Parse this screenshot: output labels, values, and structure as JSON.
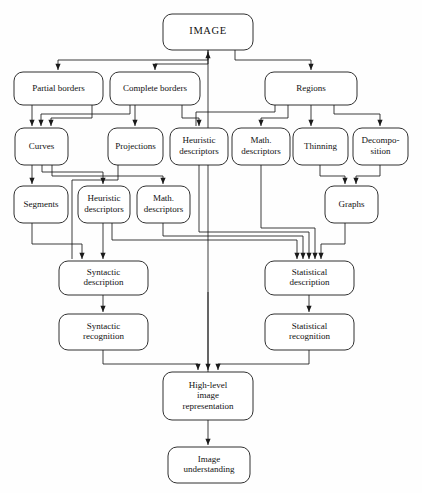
{
  "diagram": {
    "colors": {
      "background": "#fefefe",
      "node_fill": "#ffffff",
      "stroke": "#1a1a1a",
      "text": "#111111"
    },
    "nodes": [
      {
        "id": "image",
        "label": "IMAGE",
        "lines": [
          "IMAGE"
        ],
        "x": 163,
        "y": 14,
        "w": 90,
        "h": 36,
        "rx": 9,
        "emphasis": "root"
      },
      {
        "id": "partial",
        "label": "Partial borders",
        "lines": [
          "Partial borders"
        ],
        "x": 14,
        "y": 72,
        "w": 89,
        "h": 33,
        "rx": 9,
        "emphasis": "normal"
      },
      {
        "id": "complete",
        "label": "Complete borders",
        "lines": [
          "Complete borders"
        ],
        "x": 110,
        "y": 72,
        "w": 90,
        "h": 33,
        "rx": 9,
        "emphasis": "normal"
      },
      {
        "id": "regions",
        "label": "Regions",
        "lines": [
          "Regions"
        ],
        "x": 265,
        "y": 72,
        "w": 92,
        "h": 33,
        "rx": 9,
        "emphasis": "normal"
      },
      {
        "id": "curves",
        "label": "Curves",
        "lines": [
          "Curves"
        ],
        "x": 15,
        "y": 128,
        "w": 53,
        "h": 37,
        "rx": 9,
        "emphasis": "normal"
      },
      {
        "id": "projections",
        "label": "Projections",
        "lines": [
          "Projections"
        ],
        "x": 108,
        "y": 128,
        "w": 55,
        "h": 37,
        "rx": 9,
        "emphasis": "normal"
      },
      {
        "id": "heur1",
        "label": "Heuristic descriptors",
        "lines": [
          "Heuristic",
          "descriptors"
        ],
        "x": 170,
        "y": 128,
        "w": 58,
        "h": 37,
        "rx": 9,
        "emphasis": "normal"
      },
      {
        "id": "math1",
        "label": "Math. descriptors",
        "lines": [
          "Math.",
          "descriptors"
        ],
        "x": 232,
        "y": 128,
        "w": 58,
        "h": 37,
        "rx": 9,
        "emphasis": "normal"
      },
      {
        "id": "thinning",
        "label": "Thinning",
        "lines": [
          "Thinning"
        ],
        "x": 293,
        "y": 128,
        "w": 55,
        "h": 37,
        "rx": 9,
        "emphasis": "normal"
      },
      {
        "id": "decomp",
        "label": "Decomposition",
        "lines": [
          "Decompo-",
          "sition"
        ],
        "x": 353,
        "y": 128,
        "w": 55,
        "h": 37,
        "rx": 9,
        "emphasis": "normal"
      },
      {
        "id": "segments",
        "label": "Segments",
        "lines": [
          "Segments"
        ],
        "x": 14,
        "y": 186,
        "w": 54,
        "h": 37,
        "rx": 9,
        "emphasis": "normal"
      },
      {
        "id": "heur2",
        "label": "Heuristic descriptors",
        "lines": [
          "Heuristic",
          "descriptors"
        ],
        "x": 78,
        "y": 186,
        "w": 52,
        "h": 37,
        "rx": 9,
        "emphasis": "normal"
      },
      {
        "id": "math2",
        "label": "Math. descriptors",
        "lines": [
          "Math.",
          "descriptors"
        ],
        "x": 137,
        "y": 186,
        "w": 53,
        "h": 37,
        "rx": 9,
        "emphasis": "normal"
      },
      {
        "id": "graphs",
        "label": "Graphs",
        "lines": [
          "Graphs"
        ],
        "x": 325,
        "y": 186,
        "w": 53,
        "h": 37,
        "rx": 9,
        "emphasis": "normal"
      },
      {
        "id": "syndesc",
        "label": "Syntactic description",
        "lines": [
          "Syntactic",
          "description"
        ],
        "x": 59,
        "y": 261,
        "w": 89,
        "h": 34,
        "rx": 9,
        "emphasis": "normal"
      },
      {
        "id": "statdesc",
        "label": "Statistical description",
        "lines": [
          "Statistical",
          "description"
        ],
        "x": 265,
        "y": 261,
        "w": 89,
        "h": 34,
        "rx": 9,
        "emphasis": "normal"
      },
      {
        "id": "synrec",
        "label": "Syntactic recognition",
        "lines": [
          "Syntactic",
          "recognition"
        ],
        "x": 59,
        "y": 314,
        "w": 89,
        "h": 36,
        "rx": 9,
        "emphasis": "normal"
      },
      {
        "id": "statrec",
        "label": "Statistical recognition",
        "lines": [
          "Statistical",
          "recognition"
        ],
        "x": 265,
        "y": 314,
        "w": 89,
        "h": 36,
        "rx": 9,
        "emphasis": "normal"
      },
      {
        "id": "highlevel",
        "label": "High-level image representation",
        "lines": [
          "High-level",
          "image",
          "representation"
        ],
        "x": 163,
        "y": 372,
        "w": 90,
        "h": 48,
        "rx": 9,
        "emphasis": "normal"
      },
      {
        "id": "understand",
        "label": "Image understanding",
        "lines": [
          "Image",
          "understanding"
        ],
        "x": 168,
        "y": 447,
        "w": 82,
        "h": 36,
        "rx": 9,
        "emphasis": "normal"
      }
    ],
    "edges": [
      {
        "id": "e-image-partial",
        "from": "image",
        "to": "partial",
        "points": "208,50 208,60 58,60 58,70",
        "arrow": "down",
        "tip": "58,70"
      },
      {
        "id": "e-image-complete",
        "from": "image",
        "to": "complete",
        "points": "208,50 208,64 155,64 155,70",
        "arrow": "down",
        "tip": "155,70"
      },
      {
        "id": "e-image-regions",
        "from": "image",
        "to": "regions",
        "points": "235,50 235,60 311,60 311,70",
        "arrow": "down",
        "tip": "311,70"
      },
      {
        "id": "e-highlevel-image",
        "from": "highlevel",
        "to": "image",
        "points": "208,372 208,238 208,52",
        "arrow": "up",
        "tip": "208,52"
      },
      {
        "id": "e-partial-curves",
        "from": "partial",
        "to": "curves",
        "points": "32,105 32,126",
        "arrow": "down",
        "tip": "32,126"
      },
      {
        "id": "e-complete-curves",
        "from": "complete",
        "to": "curves",
        "points": "130,105 130,114 41,114 41,126",
        "arrow": "down",
        "tip": "41,126"
      },
      {
        "id": "e-complete-curves2",
        "from": "complete",
        "to": "curves",
        "points": "92,105 92,118 51,118 51,126",
        "arrow": "down",
        "tip": "51,126"
      },
      {
        "id": "e-complete-proj",
        "from": "complete",
        "to": "projections",
        "points": "135,105 135,126",
        "arrow": "down",
        "tip": "135,126"
      },
      {
        "id": "e-complete-heur1",
        "from": "complete",
        "to": "heur1",
        "points": "182,105 182,118 199,118 199,126",
        "arrow": "down",
        "tip": "199,126"
      },
      {
        "id": "e-regions-heur1",
        "from": "regions",
        "to": "heur1",
        "points": "275,105 275,112 196,112 196,118 196,126",
        "arrow": "none",
        "tip": ""
      },
      {
        "id": "e-regions-math1",
        "from": "regions",
        "to": "math1",
        "points": "288,105 288,118 261,118 261,126",
        "arrow": "down",
        "tip": "261,126"
      },
      {
        "id": "e-regions-thinning",
        "from": "regions",
        "to": "thinning",
        "points": "311,105 311,126",
        "arrow": "down",
        "tip": "311,126"
      },
      {
        "id": "e-regions-decomp",
        "from": "regions",
        "to": "decomp",
        "points": "334,105 334,114 380,114 380,126",
        "arrow": "down",
        "tip": "380,126"
      },
      {
        "id": "e-curves-segments",
        "from": "curves",
        "to": "segments",
        "points": "32,165 32,184",
        "arrow": "down",
        "tip": "32,184"
      },
      {
        "id": "e-curves-heur2",
        "from": "curves",
        "to": "heur2",
        "points": "42,165 42,172 103,172 103,184",
        "arrow": "down",
        "tip": "103,184"
      },
      {
        "id": "e-curves-math2",
        "from": "curves",
        "to": "math2",
        "points": "52,165 52,176 163,176 163,184",
        "arrow": "down",
        "tip": "163,184"
      },
      {
        "id": "e-thinning-graphs",
        "from": "thinning",
        "to": "graphs",
        "points": "320,165 320,176 345,176 345,184",
        "arrow": "down",
        "tip": "345,184"
      },
      {
        "id": "e-decomp-graphs",
        "from": "decomp",
        "to": "graphs",
        "points": "380,165 380,176 356,176 356,184",
        "arrow": "down",
        "tip": "356,184"
      },
      {
        "id": "e-segments-syndesc",
        "from": "segments",
        "to": "syndesc",
        "points": "32,223 32,244 82,244 82,259",
        "arrow": "down",
        "tip": "82,259"
      },
      {
        "id": "e-heur2-syndesc",
        "from": "heur2",
        "to": "syndesc",
        "points": "103,223 103,240 103,259",
        "arrow": "down",
        "tip": "103,259"
      },
      {
        "id": "e-math2-stat",
        "from": "math2",
        "to": "statdesc",
        "points": "163,223 163,236 303,236 303,259",
        "arrow": "down",
        "tip": "303,259"
      },
      {
        "id": "e-heur2b-stat",
        "from": "heur2",
        "to": "statdesc",
        "points": "112,223 112,240 297,240 297,259",
        "arrow": "down",
        "tip": "297,259"
      },
      {
        "id": "e-heur1-stat",
        "from": "heur1",
        "to": "statdesc",
        "points": "199,165 199,232 309,232 309,259",
        "arrow": "down",
        "tip": "309,259"
      },
      {
        "id": "e-math1-stat",
        "from": "math1",
        "to": "statdesc",
        "points": "261,165 261,228 315,228 315,259",
        "arrow": "down",
        "tip": "315,259"
      },
      {
        "id": "e-graphs-stat",
        "from": "graphs",
        "to": "statdesc",
        "points": "345,223 345,244 321,244 321,259",
        "arrow": "down",
        "tip": "321,259"
      },
      {
        "id": "e-proj-syndesc",
        "from": "projections",
        "to": "syndesc",
        "points": "118,165 118,180 72,180 72,248 72,259",
        "arrow": "none",
        "tip": ""
      },
      {
        "id": "e-syndesc-synrec",
        "from": "syndesc",
        "to": "synrec",
        "points": "103,295 103,312",
        "arrow": "down",
        "tip": "103,312"
      },
      {
        "id": "e-statdesc-statrec",
        "from": "statdesc",
        "to": "statrec",
        "points": "309,295 309,312",
        "arrow": "down",
        "tip": "309,312"
      },
      {
        "id": "e-synrec-high",
        "from": "synrec",
        "to": "highlevel",
        "points": "103,350 103,364 198,364 198,370",
        "arrow": "down",
        "tip": "198,370"
      },
      {
        "id": "e-statrec-high",
        "from": "statrec",
        "to": "highlevel",
        "points": "309,350 309,364 218,364 218,370",
        "arrow": "down",
        "tip": "218,370"
      },
      {
        "id": "e-mid-high",
        "from": "image",
        "to": "highlevel",
        "points": "208,292 208,370",
        "arrow": "down",
        "tip": "208,370"
      },
      {
        "id": "e-high-understand",
        "from": "highlevel",
        "to": "understand",
        "points": "208,420 208,445",
        "arrow": "down",
        "tip": "208,445"
      }
    ]
  }
}
